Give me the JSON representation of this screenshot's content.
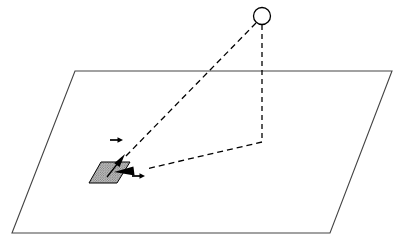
{
  "figure": {
    "domain": "diagram",
    "canvas": {
      "width": 399,
      "height": 244,
      "background": "#ffffff"
    }
  },
  "colors": {
    "background": "#ffffff",
    "plane_stroke": "#444444",
    "dashed_stroke": "#000000",
    "arrow_fill": "#000000",
    "circle_stroke": "#000000",
    "circle_fill": "#ffffff",
    "patch_fill": "#b8b8b8",
    "patch_stroke": "#000000",
    "patch_hatch": "#6a6a6a"
  },
  "elements": {
    "ground_plane": {
      "name": "ground-plane",
      "shape": "parallelogram",
      "points": "75,71 392,71 330,233 12,233",
      "stroke_width": 1.1
    },
    "light_source": {
      "name": "light-source-circle",
      "shape": "circle",
      "cx": 262,
      "cy": 16,
      "r": 8.5,
      "stroke_width": 1.3
    },
    "vertical_dashed_drop": {
      "name": "vertical-dashed-drop-line",
      "shape": "polyline",
      "points": "262,25 262,142",
      "stroke_width": 1.3,
      "dash": "5,4"
    },
    "horizontal_dashed_ray": {
      "name": "horizontal-dashed-ray",
      "shape": "polyline",
      "points": "262,142 146,169",
      "stroke_width": 1.3,
      "dash": "6,4"
    },
    "incident_dashed_ray": {
      "name": "incident-dashed-ray",
      "shape": "polyline",
      "points": "256,23 124,158",
      "stroke_width": 1.3,
      "dash": "6,4"
    },
    "surface_patch": {
      "name": "shaded-surface-patch",
      "shape": "parallelogram",
      "points": "101,162 130,162 117,183 89,183",
      "stroke_width": 1.0,
      "hatch_spacing": 2.4
    },
    "incident_arrowhead": {
      "name": "incident-direction-arrowhead",
      "shape": "filled-triangle",
      "tip": "124,155",
      "angle_deg": -45.6,
      "length": 19,
      "half_width": 4.6,
      "tail_to": "108,176"
    },
    "view_arrowhead": {
      "name": "view-direction-arrowhead",
      "shape": "filled-triangle",
      "tip": "116,173",
      "angle_deg": 193,
      "length": 19,
      "half_width": 4.8,
      "tail_to": "147,168"
    },
    "upper_tangent_arrow": {
      "name": "upper-tangent-vector-arrow",
      "shape": "small-arrow",
      "from": "110,140",
      "to": "123,140",
      "stroke_width": 1.6,
      "head_length": 5,
      "head_half_width": 3
    },
    "lower_tangent_arrow": {
      "name": "lower-tangent-vector-arrow",
      "shape": "small-arrow",
      "from": "132,176",
      "to": "145,176",
      "stroke_width": 1.6,
      "head_length": 5,
      "head_half_width": 3
    }
  },
  "labels": {
    "visible_text": []
  }
}
